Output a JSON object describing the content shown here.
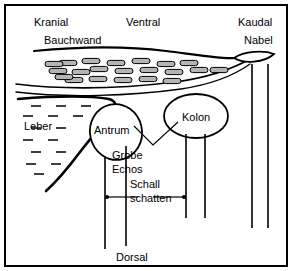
{
  "diagram": {
    "orientation_labels": {
      "top_left": "Kranial",
      "top_center": "Ventral",
      "top_right": "Kaudal",
      "bottom_center": "Dorsal"
    },
    "structures": [
      {
        "key": "bauchwand",
        "label": "Bauchwand"
      },
      {
        "key": "nabel",
        "label": "Nabel"
      },
      {
        "key": "leber",
        "label": "Leber"
      },
      {
        "key": "antrum",
        "label": "Antrum"
      },
      {
        "key": "kolon",
        "label": "Kolon"
      }
    ],
    "annotations": [
      {
        "key": "grobe_echos",
        "line1": "Grobe",
        "line2": "Echos"
      },
      {
        "key": "schallschatten",
        "line1": "Schall",
        "line2": "schatten"
      }
    ],
    "colors": {
      "line": "#000000",
      "fat_fill": "#b4b4b4",
      "background": "#ffffff",
      "border": "#000000"
    }
  },
  "chart_data": {
    "type": "diagram",
    "fat_lobules": [
      [
        62,
        57
      ],
      [
        85,
        55
      ],
      [
        110,
        57
      ],
      [
        135,
        55
      ],
      [
        160,
        58
      ],
      [
        183,
        57
      ],
      [
        52,
        65
      ],
      [
        75,
        66
      ],
      [
        93,
        63
      ],
      [
        118,
        65
      ],
      [
        143,
        64
      ],
      [
        168,
        66
      ],
      [
        193,
        64
      ],
      [
        213,
        64
      ],
      [
        68,
        74
      ],
      [
        92,
        73
      ],
      [
        117,
        74
      ],
      [
        142,
        73
      ],
      [
        166,
        75
      ],
      [
        48,
        58
      ],
      [
        58,
        71
      ]
    ],
    "liver_dashes": [
      [
        30,
        100
      ],
      [
        55,
        100
      ],
      [
        80,
        100
      ],
      [
        22,
        110
      ],
      [
        47,
        110
      ],
      [
        72,
        110
      ],
      [
        30,
        122
      ],
      [
        55,
        122
      ],
      [
        22,
        134
      ],
      [
        47,
        134
      ],
      [
        30,
        146
      ],
      [
        55,
        146
      ],
      [
        25,
        158
      ],
      [
        50,
        158
      ],
      [
        33,
        168
      ]
    ],
    "shadow_lines": [
      {
        "from": "antrum",
        "x": 99,
        "y1": 150,
        "y2": 243
      },
      {
        "from": "antrum",
        "x": 120,
        "y1": 140,
        "y2": 240
      },
      {
        "from": "kolon",
        "x": 180,
        "y1": 128,
        "y2": 212
      },
      {
        "from": "kolon",
        "x": 199,
        "y1": 128,
        "y2": 212
      },
      {
        "from": "nabel",
        "x": 246,
        "y1": 58,
        "y2": 222
      },
      {
        "from": "nabel",
        "x": 262,
        "y1": 58,
        "y2": 222
      }
    ],
    "shadow_arrows": [
      {
        "x1": 101,
        "x2": 132,
        "y": 191
      },
      {
        "x1": 178,
        "x2": 147,
        "y": 191
      }
    ]
  }
}
